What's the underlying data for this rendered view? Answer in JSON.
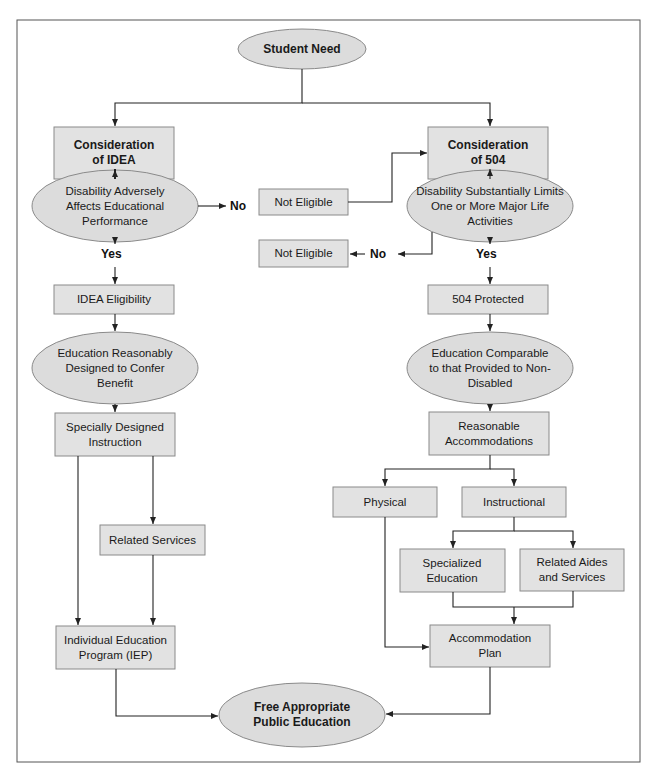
{
  "diagram": {
    "title": "Student Need",
    "nodes": {
      "student_need": "Student Need",
      "consideration_idea_1": "Consideration",
      "consideration_idea_2": "of IDEA",
      "consideration_504_1": "Consideration",
      "consideration_504_2": "of 504",
      "idea_question": "Disability Adversely Affects Educational Performance",
      "sec504_question": "Disability Substantially Limits One or More Major Life Activities",
      "not_eligible_1": "Not Eligible",
      "not_eligible_2": "Not Eligible",
      "idea_eligibility": "IDEA Eligibility",
      "protected_504": "504 Protected",
      "idea_benefit": "Education Reasonably Designed to Confer Benefit",
      "comparable_education": "Education Comparable to that Provided to Non-Disabled",
      "specially_designed": "Specially Designed Instruction",
      "reasonable_accommodations": "Reasonable Accommodations",
      "physical": "Physical",
      "instructional": "Instructional",
      "related_services": "Related Services",
      "specialized_education": "Specialized Education",
      "related_aides": "Related Aides and Services",
      "iep": "Individual Education Program (IEP)",
      "accommodation_plan": "Accommodation Plan",
      "fape": "Free Appropriate Public Education"
    },
    "edge_labels": {
      "no_left": "No",
      "no_right": "No",
      "yes_left": "Yes",
      "yes_right": "Yes"
    },
    "colors": {
      "node_fill": "#e2e2e2",
      "ellipse_fill": "#dcdcdc",
      "border": "#8a8a8a",
      "line": "#222222"
    }
  }
}
